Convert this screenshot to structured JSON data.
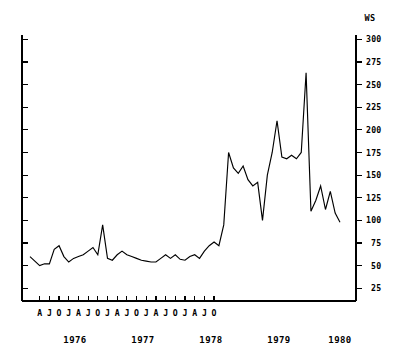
{
  "chart_data": {
    "type": "line",
    "title": "",
    "subtitle": "",
    "xlabel": "",
    "ylabel": "WS",
    "unit_label": "WS",
    "ylim": [
      0,
      300
    ],
    "yticks": [
      25,
      50,
      75,
      100,
      125,
      150,
      175,
      200,
      225,
      250,
      275,
      300
    ],
    "ytick_labels": [
      "25",
      "50",
      "75",
      "100",
      "125",
      "150",
      "175",
      "200",
      "225",
      "250",
      "275",
      "300"
    ],
    "y_axis_position": "right",
    "grid": false,
    "legend": null,
    "legend_position": "none",
    "x_tick_months": [
      "A",
      "J",
      "O",
      "J",
      "A",
      "J",
      "O",
      "J",
      "A",
      "J",
      "O",
      "J",
      "A",
      "J",
      "O",
      "J",
      "A",
      "J",
      "O"
    ],
    "x_year_labels": [
      "1976",
      "1977",
      "1978",
      "1979",
      "1980"
    ],
    "x_start": "1976-02",
    "x_end": "1980-11",
    "series": [
      {
        "name": "WS",
        "x": [
          "1976-02",
          "1976-03",
          "1976-04",
          "1976-05",
          "1976-06",
          "1976-07",
          "1976-08",
          "1976-09",
          "1976-10",
          "1976-11",
          "1976-12",
          "1977-01",
          "1977-02",
          "1977-03",
          "1977-04",
          "1977-05",
          "1977-06",
          "1977-07",
          "1977-08",
          "1977-09",
          "1977-10",
          "1977-11",
          "1977-12",
          "1978-01",
          "1978-02",
          "1978-03",
          "1978-04",
          "1978-05",
          "1978-06",
          "1978-07",
          "1978-08",
          "1978-09",
          "1978-10",
          "1978-11",
          "1978-12",
          "1979-01",
          "1979-02",
          "1979-03",
          "1979-04",
          "1979-05",
          "1979-06",
          "1979-07",
          "1979-08",
          "1979-09",
          "1979-10",
          "1979-11",
          "1979-12",
          "1980-01",
          "1980-02",
          "1980-03",
          "1980-04",
          "1980-05",
          "1980-06",
          "1980-07",
          "1980-08",
          "1980-09"
        ],
        "values": [
          60,
          55,
          50,
          52,
          52,
          68,
          72,
          60,
          54,
          58,
          60,
          62,
          66,
          70,
          62,
          95,
          58,
          56,
          62,
          66,
          62,
          60,
          58,
          56,
          55,
          54,
          54,
          58,
          62,
          58,
          62,
          57,
          56,
          60,
          62,
          58,
          66,
          72,
          76,
          72,
          95,
          175,
          158,
          152,
          160,
          145,
          138,
          142,
          100,
          150,
          175,
          210,
          170,
          168,
          172,
          168
        ]
      }
    ],
    "series_full": {
      "name": "WS",
      "values": [
        60,
        55,
        50,
        52,
        52,
        68,
        72,
        60,
        54,
        58,
        60,
        62,
        66,
        70,
        62,
        95,
        58,
        56,
        62,
        66,
        62,
        60,
        58,
        56,
        55,
        54,
        54,
        58,
        62,
        58,
        62,
        57,
        56,
        60,
        62,
        58,
        66,
        72,
        76,
        72,
        95,
        175,
        158,
        152,
        160,
        145,
        138,
        142,
        100,
        150,
        175,
        210,
        170,
        168,
        172,
        168,
        175,
        263,
        110,
        122,
        138,
        112,
        132,
        108,
        98
      ]
    },
    "annotations": [],
    "peak_value": 263,
    "peak_label": "263",
    "min_value": 50,
    "baseline_mean": 60
  },
  "page": {
    "width": 413,
    "height": 360,
    "background": "#ffffff",
    "line_color": "#000000",
    "axis_color": "#000000"
  }
}
